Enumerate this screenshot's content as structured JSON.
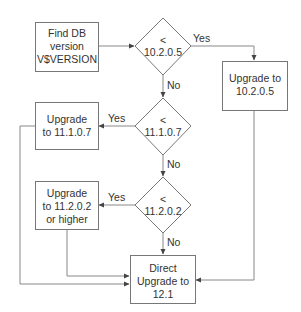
{
  "diagram": {
    "type": "flowchart",
    "nodes": {
      "find_version": {
        "shape": "rect",
        "lines": [
          "Find DB",
          "version",
          "V$VERSION"
        ]
      },
      "dec_10205": {
        "shape": "diamond",
        "lines": [
          "<",
          "10.2.0.5"
        ]
      },
      "up_10205": {
        "shape": "rect",
        "lines": [
          "Upgrade to",
          "10.2.0.5"
        ]
      },
      "dec_11107": {
        "shape": "diamond",
        "lines": [
          "<",
          "11.1.0.7"
        ]
      },
      "up_11107": {
        "shape": "rect",
        "lines": [
          "Upgrade",
          "to 11.1.0.7"
        ]
      },
      "dec_11202": {
        "shape": "diamond",
        "lines": [
          "<",
          "11.2.0.2"
        ]
      },
      "up_11202": {
        "shape": "rect",
        "lines": [
          "Upgrade",
          "to 11.2.0.2",
          "or higher"
        ]
      },
      "direct_121": {
        "shape": "rect",
        "lines": [
          "Direct",
          "Upgrade to",
          "12.1"
        ]
      }
    },
    "edges": [
      {
        "from": "find_version",
        "to": "dec_10205",
        "label": ""
      },
      {
        "from": "dec_10205",
        "to": "up_10205",
        "label": "Yes"
      },
      {
        "from": "dec_10205",
        "to": "dec_11107",
        "label": "No"
      },
      {
        "from": "dec_11107",
        "to": "up_11107",
        "label": "Yes"
      },
      {
        "from": "dec_11107",
        "to": "dec_11202",
        "label": "No"
      },
      {
        "from": "dec_11202",
        "to": "up_11202",
        "label": "Yes"
      },
      {
        "from": "dec_11202",
        "to": "direct_121",
        "label": "No"
      },
      {
        "from": "up_10205",
        "to": "direct_121",
        "label": ""
      },
      {
        "from": "up_11107",
        "to": "direct_121",
        "label": ""
      },
      {
        "from": "up_11202",
        "to": "direct_121",
        "label": ""
      }
    ],
    "labels": {
      "yes": "Yes",
      "no": "No"
    }
  }
}
